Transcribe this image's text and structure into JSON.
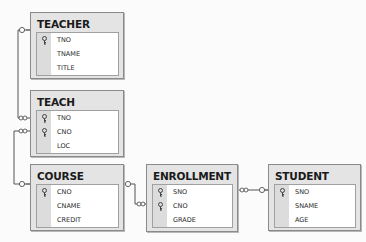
{
  "diagram": {
    "type": "database-relationship-diagram",
    "tables": [
      {
        "name": "TEACHER",
        "fields": [
          {
            "name": "TNO",
            "primary_key": true
          },
          {
            "name": "TNAME",
            "primary_key": false
          },
          {
            "name": "TITLE",
            "primary_key": false
          }
        ]
      },
      {
        "name": "TEACH",
        "fields": [
          {
            "name": "TNO",
            "primary_key": true
          },
          {
            "name": "CNO",
            "primary_key": true
          },
          {
            "name": "LOC",
            "primary_key": false
          }
        ]
      },
      {
        "name": "COURSE",
        "fields": [
          {
            "name": "CNO",
            "primary_key": true
          },
          {
            "name": "CNAME",
            "primary_key": false
          },
          {
            "name": "CREDIT",
            "primary_key": false
          }
        ]
      },
      {
        "name": "ENROLLMENT",
        "fields": [
          {
            "name": "SNO",
            "primary_key": true
          },
          {
            "name": "CNO",
            "primary_key": true
          },
          {
            "name": "GRADE",
            "primary_key": false
          }
        ]
      },
      {
        "name": "STUDENT",
        "fields": [
          {
            "name": "SNO",
            "primary_key": true
          },
          {
            "name": "SNAME",
            "primary_key": false
          },
          {
            "name": "AGE",
            "primary_key": false
          }
        ]
      }
    ],
    "relationships": [
      {
        "from": "TEACHER.TNO",
        "to": "TEACH.TNO",
        "from_end": "key",
        "to_end": "infinity"
      },
      {
        "from": "COURSE.CNO",
        "to": "TEACH.CNO",
        "from_end": "key",
        "to_end": "infinity"
      },
      {
        "from": "COURSE.CNO",
        "to": "ENROLLMENT.CNO",
        "from_end": "key",
        "to_end": "infinity"
      },
      {
        "from": "STUDENT.SNO",
        "to": "ENROLLMENT.SNO",
        "from_end": "key",
        "to_end": "infinity"
      }
    ]
  }
}
